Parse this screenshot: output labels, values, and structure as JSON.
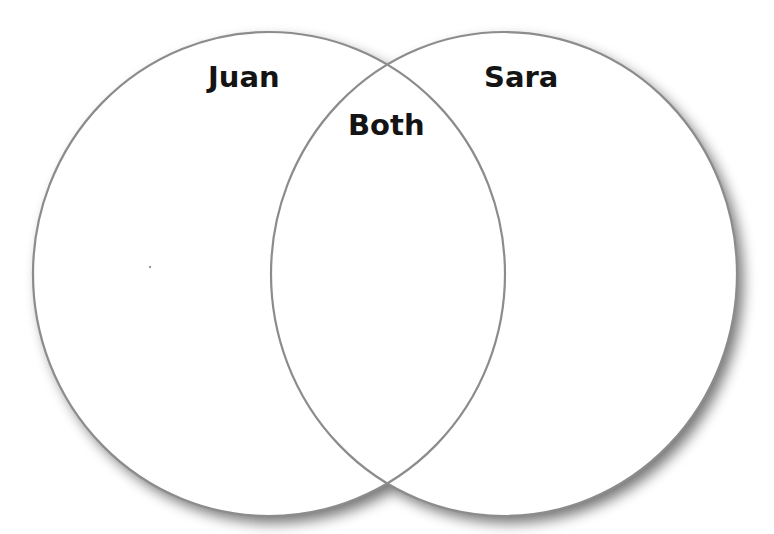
{
  "diagram": {
    "type": "venn",
    "sets": [
      {
        "id": "juan",
        "label": "Juan"
      },
      {
        "id": "sara",
        "label": "Sara"
      }
    ],
    "intersection": {
      "label": "Both"
    },
    "colors": {
      "background": "#ffffff",
      "circle_stroke": "#8c8c8c",
      "circle_fill": "#ffffff",
      "label_text": "#141414",
      "shadow": "#9a9a9a"
    }
  }
}
